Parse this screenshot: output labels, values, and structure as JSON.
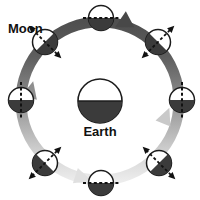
{
  "diagram": {
    "title_label": "Moon",
    "center_label": "Earth",
    "colors": {
      "orbit_dark": "#5a5a5a",
      "orbit_mid": "#8d8d8d",
      "orbit_light": "#e2e2e2",
      "body_dark": "#3a3a3a",
      "body_light": "#ffffff",
      "outline": "#1c1c1c",
      "background": "#ffffff",
      "text": "#111111"
    },
    "orbit": {
      "center_x": 100,
      "center_y": 101,
      "radius": 79,
      "stroke_width": 11,
      "direction": "counter-clockwise"
    },
    "earth": {
      "center_x": 100,
      "center_y": 101,
      "radius": 22,
      "lit_half": "top",
      "dark_half": "bottom"
    },
    "arrows": [
      {
        "name": "orbit-arrow-top",
        "x": 124,
        "y": 21,
        "rotation": 200
      },
      {
        "name": "orbit-arrow-right",
        "x": 166,
        "y": 114,
        "rotation": 290
      },
      {
        "name": "orbit-arrow-left",
        "x": 30,
        "y": 92,
        "rotation": 105
      },
      {
        "name": "orbit-arrow-bottom",
        "x": 82,
        "y": 178,
        "rotation": 20
      }
    ],
    "moons": [
      {
        "name": "moon-position-top",
        "angle_deg": 270,
        "x": 101,
        "y": 18,
        "radius": 13,
        "axis": "horizontal",
        "dark_half": "bottom"
      },
      {
        "name": "moon-position-top-right",
        "angle_deg": 315,
        "x": 158,
        "y": 42,
        "radius": 13,
        "axis": "diagonal-ne",
        "dark_half": "bottom-left"
      },
      {
        "name": "moon-position-right",
        "angle_deg": 0,
        "x": 182,
        "y": 100,
        "radius": 13,
        "axis": "vertical",
        "dark_half": "bottom"
      },
      {
        "name": "moon-position-bottom-right",
        "angle_deg": 45,
        "x": 159,
        "y": 163,
        "radius": 13,
        "axis": "diagonal-nw",
        "dark_half": "bottom-right"
      },
      {
        "name": "moon-position-bottom",
        "angle_deg": 90,
        "x": 101,
        "y": 183,
        "radius": 13,
        "axis": "horizontal",
        "dark_half": "bottom"
      },
      {
        "name": "moon-position-bottom-left",
        "angle_deg": 135,
        "x": 45,
        "y": 163,
        "radius": 13,
        "axis": "diagonal-ne",
        "dark_half": "bottom-left"
      },
      {
        "name": "moon-position-left",
        "angle_deg": 180,
        "x": 21,
        "y": 100,
        "radius": 13,
        "axis": "vertical",
        "dark_half": "bottom"
      },
      {
        "name": "moon-position-top-left",
        "angle_deg": 225,
        "x": 45,
        "y": 42,
        "radius": 13,
        "axis": "diagonal-nw",
        "dark_half": "bottom-right"
      }
    ]
  }
}
